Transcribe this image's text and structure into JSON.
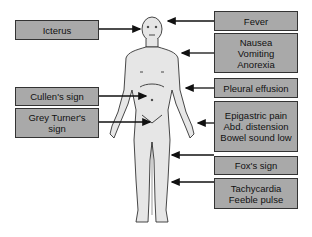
{
  "diagram": {
    "left_labels": [
      {
        "id": "icterus",
        "lines": [
          "Icterus"
        ]
      },
      {
        "id": "cullens-sign",
        "lines": [
          "Cullen's sign"
        ]
      },
      {
        "id": "grey-turners-sign",
        "lines": [
          "Grey Turner's",
          "sign"
        ]
      }
    ],
    "right_labels": [
      {
        "id": "fever",
        "lines": [
          "Fever"
        ]
      },
      {
        "id": "nausea-vomiting-anorexia",
        "lines": [
          "Nausea",
          "Vomiting",
          "Anorexia"
        ]
      },
      {
        "id": "pleural-effusion",
        "lines": [
          "Pleural effusion"
        ]
      },
      {
        "id": "epigastric-pain-group",
        "lines": [
          "Epigastric pain",
          "Abd. distension",
          "Bowel sound low"
        ]
      },
      {
        "id": "foxs-sign",
        "lines": [
          "Fox's sign"
        ]
      },
      {
        "id": "tachycardia-feeble-pulse",
        "lines": [
          "Tachycardia",
          "Feeble pulse"
        ]
      }
    ],
    "colors": {
      "box_fill": "#a9a9a9",
      "box_border": "#333333",
      "body_fill": "#e6e6e6",
      "arrow": "#111111"
    }
  }
}
